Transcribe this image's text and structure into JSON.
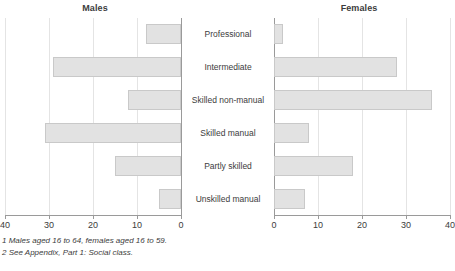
{
  "panels": {
    "left_title": "Males",
    "right_title": "Females"
  },
  "footnotes": [
    "1 Males aged 16 to 64, females aged 16 to 59.",
    "2 See Appendix, Part 1: Social class."
  ],
  "axis": {
    "left_ticks": [
      "40",
      "30",
      "20",
      "10",
      "0"
    ],
    "right_ticks": [
      "0",
      "10",
      "20",
      "30",
      "40"
    ]
  },
  "colors": {
    "bar_fill": "#e2e2e2",
    "bar_stroke": "#c9c9c9",
    "grid": "#e4e4e4",
    "axis": "#9a9a9a",
    "text": "#3c3c3c"
  },
  "categories": [
    "Professional",
    "Intermediate",
    "Skilled non-manual",
    "Skilled manual",
    "Partly skilled",
    "Unskilled manual"
  ],
  "chart_data": {
    "type": "bar",
    "title": "",
    "orientation": "horizontal",
    "layout": "back-to-back population pyramid",
    "categories": [
      "Professional",
      "Intermediate",
      "Skilled non-manual",
      "Skilled manual",
      "Partly skilled",
      "Unskilled manual"
    ],
    "series": [
      {
        "name": "Males",
        "direction": "left",
        "values": [
          8,
          29,
          12,
          31,
          15,
          5
        ]
      },
      {
        "name": "Females",
        "direction": "right",
        "values": [
          2,
          28,
          36,
          8,
          18,
          7
        ]
      }
    ],
    "xlabel": "",
    "ylabel": "",
    "xlim_left": [
      40,
      0
    ],
    "xlim_right": [
      0,
      40
    ],
    "left_ticks": [
      40,
      30,
      20,
      10,
      0
    ],
    "right_ticks": [
      0,
      10,
      20,
      30,
      40
    ],
    "grid": true,
    "legend": "none",
    "annotations": [
      "1 Males aged 16 to 64, females aged 16 to 59.",
      "2 See Appendix, Part 1: Social class."
    ]
  }
}
